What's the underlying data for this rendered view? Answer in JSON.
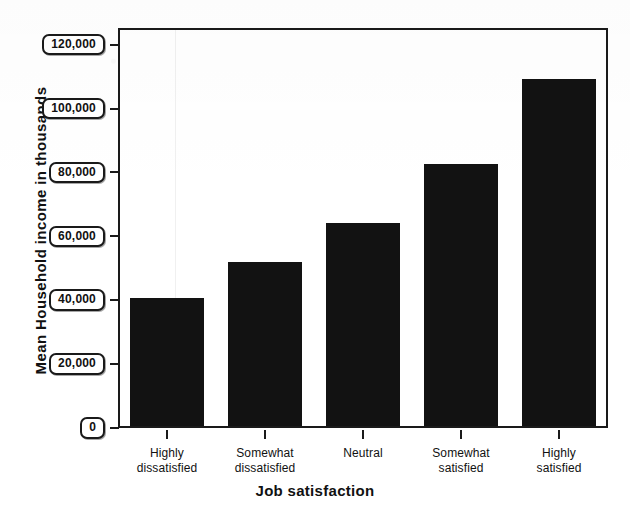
{
  "chart_data": {
    "type": "bar",
    "title": "",
    "xlabel": "Job satisfaction",
    "ylabel": "Mean Household income in thousands",
    "categories": [
      "Highly dissatisfied",
      "Somewhat dissatisfied",
      "Neutral",
      "Somewhat satisfied",
      "Highly satisfied"
    ],
    "category_lines": [
      [
        "Highly",
        "dissatisfied"
      ],
      [
        "Somewhat",
        "dissatisfied"
      ],
      [
        "Neutral",
        ""
      ],
      [
        "Somewhat",
        "satisfied"
      ],
      [
        "Highly",
        "satisfied"
      ]
    ],
    "values": [
      40000,
      51500,
      63500,
      82000,
      108500
    ],
    "ylim": [
      0,
      128000
    ],
    "yticks": [
      0,
      20000,
      40000,
      60000,
      80000,
      100000,
      120000
    ],
    "ytick_labels": [
      "0",
      "20,000",
      "40,000",
      "60,000",
      "80,000",
      "100,000",
      "120,000"
    ],
    "grid": false,
    "legend": null,
    "bar_color": "#121212",
    "axis_color": "#1a1a1a",
    "background_color": "#ffffff"
  },
  "axes": {
    "y_title": "Mean Household income in thousands",
    "x_title": "Job satisfaction"
  }
}
